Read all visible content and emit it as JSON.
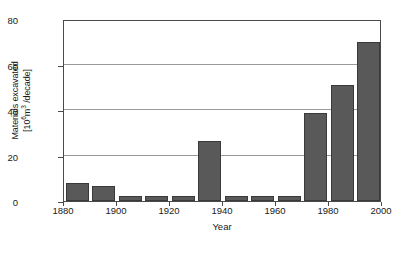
{
  "chart_data": {
    "type": "bar",
    "title": "",
    "xlabel": "Year",
    "ylabel_line1": "Materials excavated",
    "ylabel_line2_prefix": "[10",
    "ylabel_line2_exp1": "6",
    "ylabel_line2_mid": "m",
    "ylabel_line2_exp2": "3",
    "ylabel_line2_suffix": " /decade]",
    "ylabel_plain": "Materials excavated [10^6 m^3 /decade]",
    "categories": [
      "1880",
      "1890",
      "1900",
      "1910",
      "1920",
      "1930",
      "1940",
      "1950",
      "1960",
      "1970",
      "1980",
      "1990"
    ],
    "bar_starts": [
      1880,
      1890,
      1900,
      1910,
      1920,
      1930,
      1940,
      1950,
      1960,
      1970,
      1980,
      1990
    ],
    "values": [
      8,
      6.5,
      2,
      2,
      2,
      26.5,
      2,
      2,
      2,
      38.5,
      51,
      70
    ],
    "xlim": [
      1880,
      2000
    ],
    "ylim": [
      0,
      80
    ],
    "xticks": [
      1880,
      1900,
      1920,
      1940,
      1960,
      1980,
      2000
    ],
    "xtick_labels": [
      "1880",
      "1900",
      "1920",
      "1940",
      "1960",
      "1980",
      "2000"
    ],
    "yticks": [
      0,
      20,
      40,
      60,
      80
    ],
    "ytick_labels": [
      "0",
      "20",
      "40",
      "60",
      "80"
    ],
    "gridlines_y": [
      20,
      40,
      60
    ],
    "grid": "horizontal",
    "legend": "none",
    "bar_color": "#595959",
    "bar_edge_color": "#3a3a3a",
    "grid_color": "#9a9a9a",
    "frame_color": "#4a4a4a",
    "background": "#ffffff"
  }
}
